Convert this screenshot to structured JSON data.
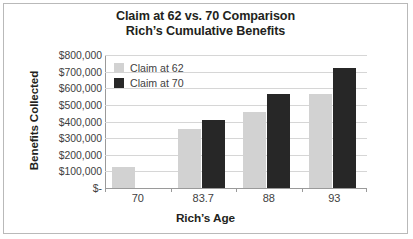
{
  "chart_data": {
    "type": "bar",
    "title_line1": "Claim at 62 vs. 70 Comparison",
    "title_line2": "Rich’s Cumulative Benefits",
    "xlabel": "Rich’s Age",
    "ylabel": "Benefits Collected",
    "categories": [
      "70",
      "83.7",
      "88",
      "93"
    ],
    "series": [
      {
        "name": "Claim at 62",
        "color": "#d2d2d2",
        "values": [
          127000,
          355000,
          460000,
          565000
        ]
      },
      {
        "name": "Claim at 70",
        "color": "#272727",
        "values": [
          0,
          410000,
          565000,
          720000
        ]
      }
    ],
    "ylim": [
      0,
      800000
    ],
    "ytick_values": [
      800000,
      700000,
      600000,
      500000,
      400000,
      300000,
      200000,
      100000,
      0
    ],
    "ytick_labels": [
      "$800,000",
      "$700,000",
      "$600,000",
      "$500,000",
      "$400,000",
      "$300,000",
      "$200,000",
      "$100,000",
      "$-"
    ],
    "grid": true,
    "legend_position": "top-left-inside"
  },
  "colors": {
    "frame_border": "#b9b9b9",
    "gridline": "#d6d6d6",
    "axis_line": "#9a9a9a",
    "title_text": "#231f20",
    "tick_text": "#414141"
  }
}
